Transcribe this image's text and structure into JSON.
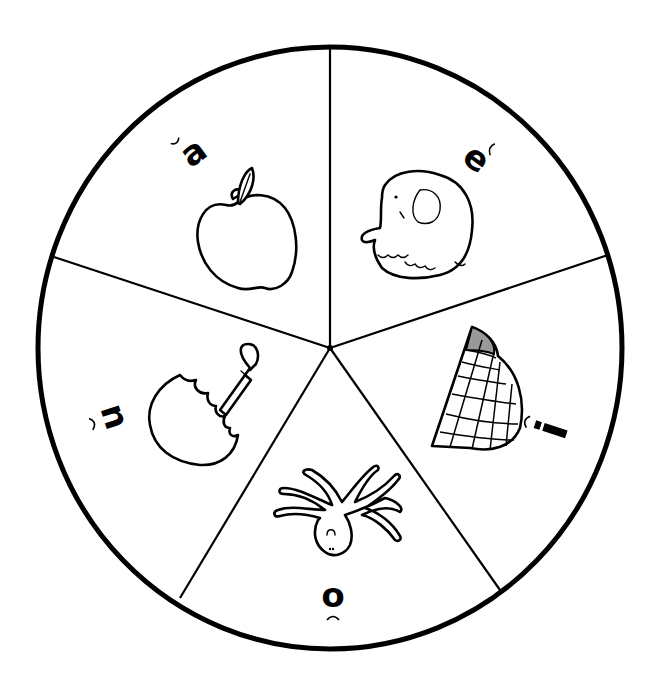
{
  "wheel": {
    "center": [
      330,
      348
    ],
    "radius": 297,
    "line_color": "#000000",
    "background": "#ffffff",
    "slice_count": 5
  },
  "slices": [
    {
      "id": "a",
      "letter": "a",
      "mark": "breve",
      "sound": "short a",
      "picture": "apple",
      "position": "upper-left"
    },
    {
      "id": "e",
      "letter": "e",
      "mark": "breve",
      "sound": "short e",
      "picture": "elephant",
      "position": "upper-right"
    },
    {
      "id": "i",
      "letter": "i",
      "mark": "breve",
      "sound": "short i",
      "picture": "igloo",
      "position": "right"
    },
    {
      "id": "o",
      "letter": "o",
      "mark": "breve",
      "sound": "short o",
      "picture": "octopus",
      "position": "bottom"
    },
    {
      "id": "u",
      "letter": "u",
      "mark": "breve",
      "sound": "short u",
      "picture": "umbrella",
      "position": "left"
    }
  ]
}
